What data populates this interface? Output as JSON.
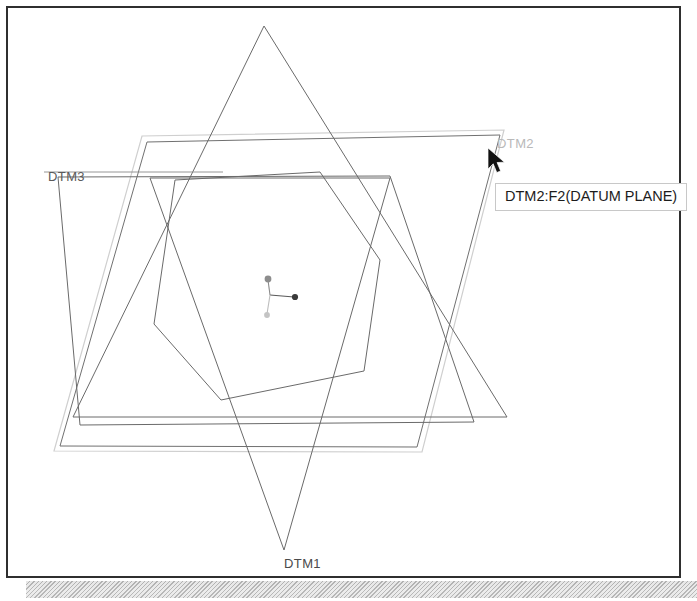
{
  "app": {
    "kind": "cad-3d-datum-plane-view",
    "background_color": "#ffffff",
    "frame_border_color": "#2f2f2f"
  },
  "canvas": {
    "width": 675,
    "height": 572,
    "line_color": "#4a4a4a",
    "highlight_color": "#c9c9c9"
  },
  "labels": {
    "dtm1": "DTM1",
    "dtm2": "DTM2",
    "dtm3": "DTM3"
  },
  "tooltip": {
    "text": "DTM2:F2(DATUM PLANE)",
    "border_color": "#c8c8c8",
    "background_color": "#ffffff",
    "text_color": "#1c1c1c"
  },
  "cursor": {
    "icon": "arrow-pointer-icon",
    "color": "#111111",
    "x": 483,
    "y": 145
  },
  "csys": {
    "name": "coordinate-system-marker",
    "origin_x": 268,
    "origin_y": 291,
    "axes": [
      {
        "name": "axis-x",
        "end_x": 292,
        "end_y": 294,
        "dot_color": "#3a3a3a"
      },
      {
        "name": "axis-y",
        "end_x": 266,
        "end_y": 278,
        "dot_color": "#8a8a8a"
      },
      {
        "name": "axis-z",
        "end_x": 265,
        "end_y": 312,
        "dot_color": "#bdbdbd"
      }
    ]
  },
  "geometry": {
    "dtm1_triangle_up": {
      "label": "DTM1",
      "points": "262,24 71,415 505,415"
    },
    "dtm1_triangle_down": {
      "label": "DTM1-lower",
      "points": "148,176 388,176 282,548"
    },
    "dtm1_hexagon": {
      "label": "DTM1-hexagon",
      "points": "173,178 318,170 378,258 362,369 219,398 152,322"
    },
    "dtm2_plane": {
      "label": "DTM2",
      "points": "145,140 498,133 415,445 58,444"
    },
    "dtm2_plane_highlight": {
      "label": "DTM2-highlight",
      "points": "140,134 502,128 420,450 52,449"
    },
    "dtm3_plane": {
      "label": "DTM3",
      "points": "56,175 388,174 472,420 78,423"
    }
  }
}
